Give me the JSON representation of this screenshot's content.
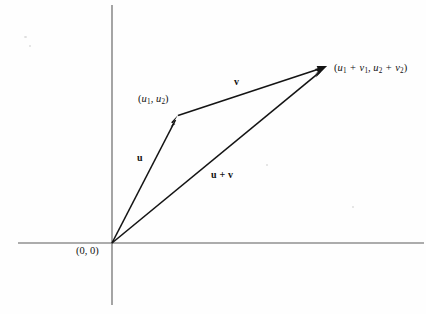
{
  "figure": {
    "background_color": "#fefefe",
    "axis_color": "#5a5a5a",
    "vector_color": "#141414"
  },
  "axes": {
    "x_axis": {
      "name": "horizontal-axis",
      "y": 243,
      "x_start": 18,
      "x_end": 424
    },
    "y_axis": {
      "name": "vertical-axis",
      "x": 112,
      "y_start": 5,
      "y_end": 305
    }
  },
  "points": {
    "origin": {
      "x": 112,
      "y": 243,
      "label": "(0, 0)"
    },
    "u_tip": {
      "x": 178,
      "y": 115
    },
    "sum_tip": {
      "x": 327,
      "y": 66
    }
  },
  "labels": {
    "origin": {
      "text": "(0, 0)",
      "x": 76,
      "y": 246
    },
    "u_point": {
      "open": "(",
      "var1": "u",
      "sub1": "1",
      "comma": ", ",
      "var2": "u",
      "sub2": "2",
      "close": ")",
      "x": 138,
      "y": 94
    },
    "sum_point": {
      "open": "(",
      "var1": "u",
      "sub1": "1",
      "op1": " + ",
      "var2": "v",
      "sub2": "1",
      "comma": ", ",
      "var3": "u",
      "sub3": "2",
      "op2": " + ",
      "var4": "v",
      "sub4": "2",
      "close": ")",
      "x": 334,
      "y": 63
    },
    "vector_u": {
      "text": "u",
      "x": 137,
      "y": 153
    },
    "vector_v": {
      "text": "v",
      "x": 234,
      "y": 77
    },
    "vector_sum": {
      "text": "u + v",
      "x": 211,
      "y": 170
    }
  },
  "vectors": [
    {
      "name": "vector-u",
      "label": "u",
      "from": {
        "x": 112,
        "y": 243
      },
      "to": {
        "x": 178,
        "y": 115
      }
    },
    {
      "name": "vector-v",
      "label": "v",
      "from": {
        "x": 178,
        "y": 115
      },
      "to": {
        "x": 327,
        "y": 66
      }
    },
    {
      "name": "vector-u-plus-v",
      "label": "u + v",
      "from": {
        "x": 112,
        "y": 243
      },
      "to": {
        "x": 327,
        "y": 66
      }
    }
  ]
}
